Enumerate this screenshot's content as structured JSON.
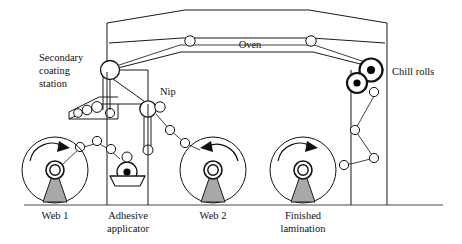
{
  "diagram": {
    "type": "process-flow-schematic",
    "colors": {
      "line": "#1a1a1a",
      "stand_fill": "#a8a8a8",
      "roll_fill": "#ffffff",
      "chill_hub": "#000000",
      "ground": "#4a4a4a",
      "background": "#ffffff"
    },
    "labels": {
      "secondary_coating_station_line1": "Secondary",
      "secondary_coating_station_line2": "coating",
      "secondary_coating_station_line3": "station",
      "nip": "Nip",
      "oven": "Oven",
      "chill_rolls": "Chill rolls",
      "web1": "Web 1",
      "adhesive_applicator_line1": "Adhesive",
      "adhesive_applicator_line2": "applicator",
      "web2": "Web 2",
      "finished_lamination_line1": "Finished",
      "finished_lamination_line2": "lamination"
    },
    "stations": [
      {
        "name": "web1",
        "label": "Web 1",
        "rotation": "clockwise",
        "kind": "unwind-roll"
      },
      {
        "name": "adhesive-applicator",
        "label": "Adhesive applicator",
        "kind": "dip-pan-applicator"
      },
      {
        "name": "web2",
        "label": "Web 2",
        "rotation": "counterclockwise",
        "kind": "unwind-roll"
      },
      {
        "name": "finished-lamination",
        "label": "Finished lamination",
        "rotation": "clockwise",
        "kind": "windup-roll"
      },
      {
        "name": "secondary-coating-station",
        "label": "Secondary coating station",
        "kind": "coating-trough"
      },
      {
        "name": "nip",
        "label": "Nip",
        "kind": "nip-rollers"
      },
      {
        "name": "oven",
        "label": "Oven",
        "kind": "drying-oven"
      },
      {
        "name": "chill-rolls",
        "label": "Chill rolls",
        "kind": "chill-roll-pair",
        "count": 2
      }
    ]
  }
}
